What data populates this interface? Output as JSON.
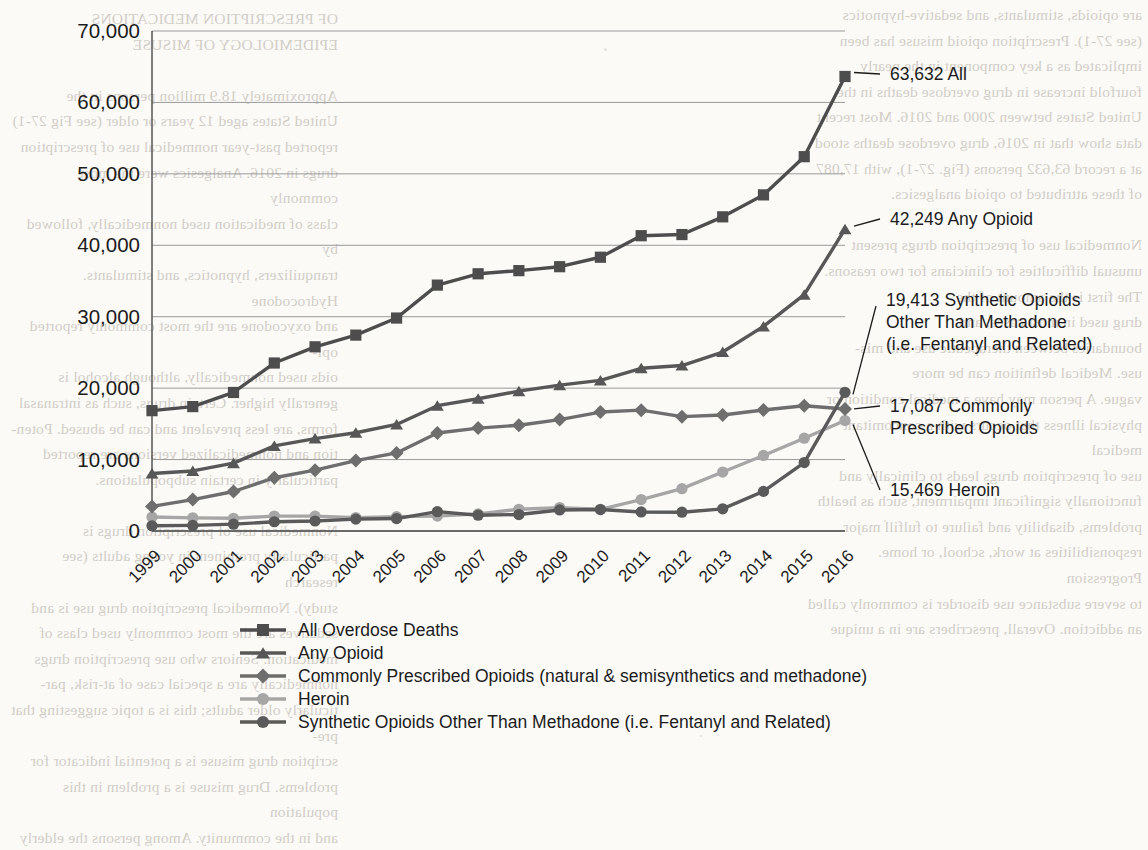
{
  "page": {
    "background_color": "#fbfaf7",
    "bleed_through_left": "OF PRESCRIPTION MEDICATIONS\nEPIDEMIOLOGY OF MISUSE\n\nApproximately 18.9 million persons in the\nUnited States aged 12 years or older (see Fig 27-1)\nreported past-year nonmedical use of prescription\ndrugs in 2016. Analgesics were the most commonly\nclass of medication used nonmedically, followed by\ntranquilizers, hypnotics, and stimulants. Hydrocodone\nand oxycodone are the most commonly reported opi-\noids used nonmedically, although alcohol is\ngenerally higher. Certain drugs, such as intranasal\nforms, are less prevalent and can be abused. Poten-\ntion and nonmedicalized versions are reported\nparticularly in certain subpopulations.\n\nNonmedical use of prescription drugs is\nparticularly prominent in young adults (see research\nstudy). Nonmedical prescription drug use is and\nsedatives are the most commonly used class of\nmedication. Seniors who use prescription drugs\nnonmedically are a special case of at-risk, par-\nticularly older adults; this is a topic suggesting that pre-\nscription drug misuse is a potential indicator for\nproblems. Drug misuse is a problem in this population\nand in the community. Among persons the elderly",
    "bleed_through_right": "are opioids, stimulants, and sedative-hypnotics\n(see 27-1). Prescription opioid misuse has been\nimplicated as a key component in the nearly\nfourfold increase in drug overdose deaths in the\nUnited States between 2000 and 2016. Most recent\ndata show that in 2016, drug overdose deaths stood\nat a record 63,632 persons (Fig. 27-1), with 17,087\nof these attributed to opioid analgesics.\n\nNonmedical use of prescription drugs present\nunusual difficulties for clinicians for two reasons.\nThe first is the amount of the\ndrug used in most cases, and\nboundaries between therapeutic use and mis-\nuse. Medical definition can be more\nvague. A person may have a medical condition or\nphysical illness that occurs with a concomitant medical\nuse of prescription drugs leads to clinically and\nfunctionally significant impairment, such as health\nproblems, disability and failure to fulfill major\nresponsibilities at work, school, or home. Progression\nto severe substance use disorder is commonly called\nan addiction. Overall, prescribers are in a unique",
    "bleed_through_mid": "Conflict of Interest Disclosure"
  },
  "chart_data": {
    "type": "line",
    "title": "",
    "subtitle": "",
    "xlabel": "",
    "ylabel": "",
    "ylim": [
      0,
      70000
    ],
    "ytick_labels": [
      "0",
      "10,000",
      "20,000",
      "30,000",
      "40,000",
      "50,000",
      "60,000",
      "70,000"
    ],
    "ytick_values": [
      0,
      10000,
      20000,
      30000,
      40000,
      50000,
      60000,
      70000
    ],
    "grid": true,
    "legend_position": "bottom",
    "categories": [
      "1999",
      "2000",
      "2001",
      "2002",
      "2003",
      "2004",
      "2005",
      "2006",
      "2007",
      "2008",
      "2009",
      "2010",
      "2011",
      "2012",
      "2013",
      "2014",
      "2015",
      "2016"
    ],
    "series": [
      {
        "name": "All Overdose Deaths",
        "legend_label": "All Overdose Deaths",
        "marker": "square",
        "color": "#4d4d4d",
        "values": [
          16849,
          17415,
          19394,
          23518,
          25785,
          27424,
          29813,
          34425,
          36010,
          36450,
          37004,
          38329,
          41340,
          41502,
          43982,
          47055,
          52404,
          63632
        ]
      },
      {
        "name": "Any Opioid",
        "legend_label": "Any Opioid",
        "marker": "triangle",
        "color": "#575757",
        "values": [
          8048,
          8407,
          9496,
          11920,
          12940,
          13756,
          14918,
          17545,
          18516,
          19582,
          20422,
          21089,
          22784,
          23166,
          25052,
          28647,
          33091,
          42249
        ]
      },
      {
        "name": "Commonly Prescribed Opioids",
        "legend_label": "Commonly Prescribed Opioids (natural & semisynthetics and methadone)",
        "marker": "diamond",
        "color": "#6e6e6e",
        "values": [
          3442,
          4400,
          5528,
          7456,
          8517,
          9857,
          10928,
          13723,
          14408,
          14800,
          15597,
          16651,
          16917,
          16007,
          16235,
          16941,
          17536,
          17087
        ]
      },
      {
        "name": "Heroin",
        "legend_label": "Heroin",
        "marker": "circle",
        "color": "#a6a6a6",
        "values": [
          1960,
          1842,
          1779,
          2089,
          2080,
          1878,
          2009,
          2088,
          2399,
          3041,
          3278,
          3036,
          4397,
          5925,
          8257,
          10574,
          12989,
          15469
        ]
      },
      {
        "name": "Synthetic Opioids Other Than Methadone",
        "legend_label": "Synthetic Opioids Other Than Methadone (i.e. Fentanyl and Related)",
        "marker": "circle",
        "color": "#5a5a5a",
        "values": [
          730,
          782,
          957,
          1295,
          1400,
          1664,
          1742,
          2707,
          2213,
          2306,
          2946,
          3007,
          2666,
          2628,
          3105,
          5544,
          9580,
          19413
        ]
      }
    ],
    "callouts": [
      {
        "id": "all",
        "text": "63,632 All",
        "series": "All Overdose Deaths",
        "value": 63632
      },
      {
        "id": "any-opioid",
        "text": "42,249 Any Opioid",
        "series": "Any Opioid",
        "value": 42249
      },
      {
        "id": "synthetic",
        "text_line1": "19,413 Synthetic Opioids",
        "text_line2": "Other Than Methadone",
        "text_line3": "(i.e. Fentanyl and Related)",
        "series": "Synthetic Opioids Other Than Methadone",
        "value": 19413
      },
      {
        "id": "prescribed",
        "text_line1": "17,087 Commonly",
        "text_line2": "Prescribed Opioids",
        "series": "Commonly Prescribed Opioids",
        "value": 17087
      },
      {
        "id": "heroin",
        "text": "15,469 Heroin",
        "series": "Heroin",
        "value": 15469
      }
    ]
  }
}
